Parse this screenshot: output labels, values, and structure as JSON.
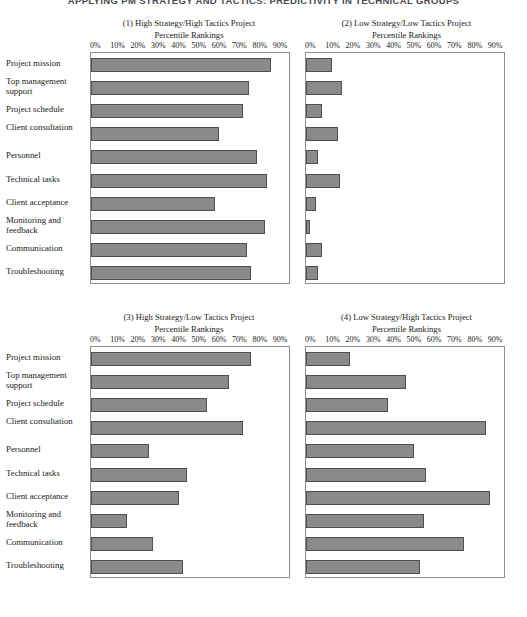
{
  "running_head": "APPLYING PM STRATEGY AND TACTICS: PREDICTIVITY IN TECHNICAL GROUPS",
  "axis": {
    "subtitle": "Percentile Rankings",
    "ticks": [
      "0%",
      "10%",
      "20%",
      "30%",
      "40%",
      "50%",
      "60%",
      "70%",
      "80%",
      "90%"
    ],
    "xmin": 0,
    "xmax": 100
  },
  "categories": [
    "Project mission",
    "Top management support",
    "Project schedule",
    "Client consultation",
    "Personnel",
    "Technical tasks",
    "Client acceptance",
    "Monitoring and feedback",
    "Communication",
    "Troubleshooting"
  ],
  "colors": {
    "bar_fill": "#8a8a8a",
    "bar_stroke": "#4f4f4f",
    "plot_frame": "#8d8d8d",
    "text": "#1a1a1a"
  },
  "chart_data": [
    {
      "type": "bar",
      "orientation": "horizontal",
      "panel": "1",
      "title": "(1) High Strategy/High Tactics Project",
      "subtitle": "Percentile Rankings",
      "xlabel": "Percentile Rankings",
      "ylabel": "",
      "xlim": [
        0,
        100
      ],
      "grid": false,
      "legend": "none",
      "categories": [
        "Project mission",
        "Top management support",
        "Project schedule",
        "Client consultation",
        "Personnel",
        "Technical tasks",
        "Client acceptance",
        "Monitoring and feedback",
        "Communication",
        "Troubleshooting"
      ],
      "values": [
        90,
        79,
        76,
        64,
        83,
        88,
        62,
        87,
        78,
        80
      ]
    },
    {
      "type": "bar",
      "orientation": "horizontal",
      "panel": "2",
      "title": "(2) Low Strategy/Low Tactics Project",
      "subtitle": "Percentile Rankings",
      "xlabel": "Percentile Rankings",
      "ylabel": "",
      "xlim": [
        0,
        100
      ],
      "grid": false,
      "legend": "none",
      "categories": [
        "Project mission",
        "Top management support",
        "Project schedule",
        "Client consultation",
        "Personnel",
        "Technical tasks",
        "Client acceptance",
        "Monitoring and feedback",
        "Communication",
        "Troubleshooting"
      ],
      "values": [
        13,
        18,
        8,
        16,
        6,
        17,
        5,
        2,
        8,
        6
      ]
    },
    {
      "type": "bar",
      "orientation": "horizontal",
      "panel": "3",
      "title": "(3) High Strategy/Low Tactics Project",
      "subtitle": "Percentile Rankings",
      "xlabel": "Percentile Rankings",
      "ylabel": "",
      "xlim": [
        0,
        100
      ],
      "grid": false,
      "legend": "none",
      "categories": [
        "Project mission",
        "Top management support",
        "Project schedule",
        "Client consultation",
        "Personnel",
        "Technical tasks",
        "Client acceptance",
        "Monitoring and feedback",
        "Communication",
        "Troubleshooting"
      ],
      "values": [
        80,
        69,
        58,
        76,
        29,
        48,
        44,
        18,
        31,
        46
      ]
    },
    {
      "type": "bar",
      "orientation": "horizontal",
      "panel": "4",
      "title": "(4) Low Strategy/High Tactics Project",
      "subtitle": "Percentile Rankings",
      "xlabel": "Percentile Rankings",
      "ylabel": "",
      "xlim": [
        0,
        100
      ],
      "grid": false,
      "legend": "none",
      "categories": [
        "Project mission",
        "Top management support",
        "Project schedule",
        "Client consultation",
        "Personnel",
        "Technical tasks",
        "Client acceptance",
        "Monitoring and feedback",
        "Communication",
        "Troubleshooting"
      ],
      "values": [
        22,
        50,
        41,
        90,
        54,
        60,
        92,
        59,
        79,
        57
      ]
    }
  ]
}
